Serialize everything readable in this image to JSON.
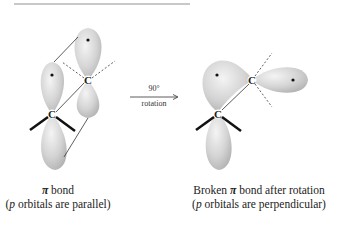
{
  "figure": {
    "left": {
      "atom_top": "C",
      "atom_bottom": "C",
      "caption_symbol": "π",
      "caption_title": " bond",
      "caption_sub_open": "(",
      "caption_sub_italic": "p",
      "caption_sub_rest": " orbitals are parallel)"
    },
    "arrow": {
      "top_label": "90°",
      "bottom_label": "rotation"
    },
    "right": {
      "atom_top": "C",
      "atom_bottom": "C",
      "caption_title_prefix": "Broken ",
      "caption_symbol": "π",
      "caption_title_suffix": " bond after rotation",
      "caption_sub_open": "(",
      "caption_sub_italic": "p",
      "caption_sub_rest": " orbitals are perpendicular)"
    },
    "colors": {
      "orbital_light": "#f2f2f2",
      "orbital_dark": "#b9b9b9",
      "line": "#333333",
      "rule": "#c8c8c8"
    }
  }
}
